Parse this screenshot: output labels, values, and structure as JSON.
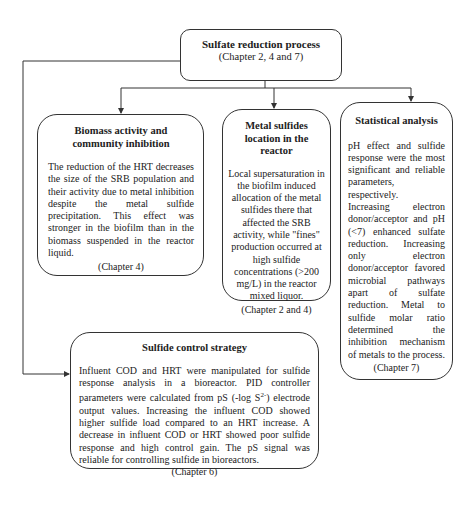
{
  "root": {
    "title": "Sulfate reduction process",
    "chapter": "(Chapter 2, 4 and 7)"
  },
  "boxes": [
    {
      "id": "biomass",
      "title": "Biomass activity and community inhibition",
      "text": "The reduction of the HRT decreases the size of the SRB population and their activity due to metal inhibition despite the metal sulfide precipitation. This effect was stronger in the biofilm than in the biomass suspended in the reactor liquid.",
      "chapter": "(Chapter 4)"
    },
    {
      "id": "metal-sulfides",
      "title": "Metal sulfides location in the reactor",
      "text": "Local supersaturation in the biofilm induced allocation of the metal sulfides there that affected the SRB activity, while \"fines\" production occurred at high sulfide concentrations (>200 mg/L) in the reactor mixed liquor.",
      "chapter": "(Chapter 2 and 4)"
    },
    {
      "id": "statistical",
      "title": "Statistical analysis",
      "text_1": "pH effect and sulfide response were the most significant and reliable parameters, respectively.",
      "text_2": "Increasing electron donor/acceptor and pH (<7) enhanced sulfate reduction. Increasing only electron donor/acceptor favored microbial pathways apart of sulfate reduction. Metal to sulfide molar ratio determined the inhibition mechanism of metals to the process.",
      "chapter": "(Chapter 7)"
    },
    {
      "id": "sulfide-control",
      "title": "Sulfide control strategy",
      "text_a": "Influent COD and HRT were manipulated for sulfide response analysis in a bioreactor. PID controller parameters were calculated from pS (-log S",
      "text_sup": "2-",
      "text_b": ") electrode output values. Increasing the influent COD showed higher sulfide load compared to an HRT increase. A decrease in influent COD or HRT showed poor sulfide response and high control gain. The pS signal was reliable for controlling sulfide in bioreactors.",
      "chapter": "(Chapter 6)"
    }
  ],
  "colors": {
    "line": "#333333",
    "text": "#222222",
    "background": "#ffffff"
  }
}
